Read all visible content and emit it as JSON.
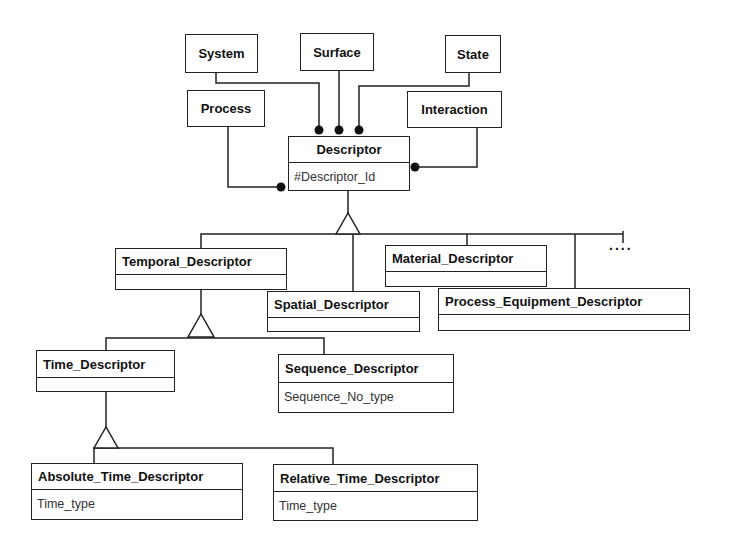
{
  "diagram": {
    "type": "UML class diagram",
    "associated_classes": [
      {
        "id": "system",
        "label": "System"
      },
      {
        "id": "surface",
        "label": "Surface"
      },
      {
        "id": "state",
        "label": "State"
      },
      {
        "id": "process",
        "label": "Process"
      },
      {
        "id": "interaction",
        "label": "Interaction"
      }
    ],
    "root": {
      "name": "Descriptor",
      "attribute": "#Descriptor_Id"
    },
    "classes": {
      "temporal": {
        "name": "Temporal_Descriptor",
        "attribute": ""
      },
      "spatial": {
        "name": "Spatial_Descriptor",
        "attribute": ""
      },
      "material": {
        "name": "Material_Descriptor",
        "attribute": ""
      },
      "process_equipment": {
        "name": "Process_Equipment_Descriptor",
        "attribute": ""
      },
      "time": {
        "name": "Time_Descriptor",
        "attribute": ""
      },
      "sequence": {
        "name": "Sequence_Descriptor",
        "attribute": "Sequence_No_type"
      },
      "absolute_time": {
        "name": "Absolute_Time_Descriptor",
        "attribute": "Time_type"
      },
      "relative_time": {
        "name": "Relative_Time_Descriptor",
        "attribute": "Time_type"
      }
    },
    "more_indicator": "....",
    "relationships": [
      {
        "from": "System",
        "to": "Descriptor",
        "type": "association"
      },
      {
        "from": "Surface",
        "to": "Descriptor",
        "type": "association"
      },
      {
        "from": "State",
        "to": "Descriptor",
        "type": "association"
      },
      {
        "from": "Process",
        "to": "Descriptor",
        "type": "association"
      },
      {
        "from": "Interaction",
        "to": "Descriptor",
        "type": "association"
      },
      {
        "child": "Temporal_Descriptor",
        "parent": "Descriptor",
        "type": "generalization"
      },
      {
        "child": "Spatial_Descriptor",
        "parent": "Descriptor",
        "type": "generalization"
      },
      {
        "child": "Material_Descriptor",
        "parent": "Descriptor",
        "type": "generalization"
      },
      {
        "child": "Process_Equipment_Descriptor",
        "parent": "Descriptor",
        "type": "generalization"
      },
      {
        "child": "Time_Descriptor",
        "parent": "Temporal_Descriptor",
        "type": "generalization"
      },
      {
        "child": "Sequence_Descriptor",
        "parent": "Temporal_Descriptor",
        "type": "generalization"
      },
      {
        "child": "Absolute_Time_Descriptor",
        "parent": "Time_Descriptor",
        "type": "generalization"
      },
      {
        "child": "Relative_Time_Descriptor",
        "parent": "Time_Descriptor",
        "type": "generalization"
      }
    ]
  },
  "colors": {
    "line": "#222222",
    "background": "#ffffff"
  }
}
